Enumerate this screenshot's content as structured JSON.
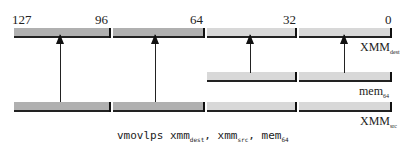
{
  "diagram": {
    "bit_labels": [
      "127",
      "96",
      "64",
      "32",
      "0"
    ],
    "registers": {
      "dest": {
        "name": "XMM",
        "sub": "dest"
      },
      "mem": {
        "name": "mem",
        "sub": "64"
      },
      "src": {
        "name": "XMM",
        "sub": "src"
      }
    },
    "instruction": {
      "mnemonic": "vmovlps",
      "op1": "xmm",
      "op1_sub": "dest",
      "op2": "xmm",
      "op2_sub": "src",
      "op3": "mem",
      "op3_sub": "64",
      "sep": ","
    },
    "colors": {
      "dark_segment": "#b0b0b0",
      "light_segment": "#d8d8d8",
      "line": "#222222"
    }
  }
}
